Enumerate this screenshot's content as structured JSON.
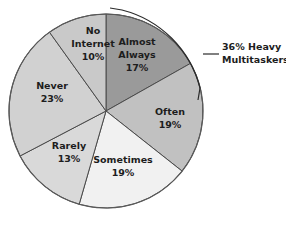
{
  "chart_data": {
    "type": "pie",
    "title": "",
    "subtitle": "",
    "xlabel": "",
    "ylabel": "",
    "grid": false,
    "legend_position": "inside-slices",
    "start_angle_deg": 0,
    "direction": "clockwise",
    "geometry": {
      "cx": 106,
      "cy": 111,
      "r": 97
    },
    "categories": [
      "Almost Always",
      "Often",
      "Sometimes",
      "Rarely",
      "Never",
      "No Internet"
    ],
    "values": [
      17,
      19,
      19,
      13,
      23,
      10
    ],
    "value_suffix": "%",
    "slices": [
      {
        "label": "Almost Always",
        "label_line1": "Almost",
        "label_line2": "Always",
        "value": 17,
        "value_text": "17%",
        "color": "#9a9a9a",
        "label_x": 137,
        "label_y": 50
      },
      {
        "label": "Often",
        "label_line1": "Often",
        "label_line2": "",
        "value": 19,
        "value_text": "19%",
        "color": "#c1c1c1",
        "label_x": 170,
        "label_y": 118
      },
      {
        "label": "Sometimes",
        "label_line1": "Sometimes",
        "label_line2": "",
        "value": 19,
        "value_text": "19%",
        "color": "#f1f1f1",
        "label_x": 123,
        "label_y": 166
      },
      {
        "label": "Rarely",
        "label_line1": "Rarely",
        "label_line2": "",
        "value": 13,
        "value_text": "13%",
        "color": "#d9d9d9",
        "label_x": 69,
        "label_y": 152
      },
      {
        "label": "Never",
        "label_line1": "Never",
        "label_line2": "",
        "value": 23,
        "value_text": "23%",
        "color": "#d1d1d1",
        "label_x": 52,
        "label_y": 92
      },
      {
        "label": "No Internet",
        "label_line1": "No",
        "label_line2": "Internet",
        "value": 10,
        "value_text": "10%",
        "color": "#c9c9c9",
        "label_x": 93,
        "label_y": 44
      }
    ],
    "annotations": [
      {
        "name": "heavy-multitaskers-callout",
        "line1": "36% Heavy",
        "line2": "Multitaskers",
        "covers": [
          "Almost Always",
          "Often"
        ],
        "total": 36,
        "text_x": 226,
        "text_y1": 44,
        "text_y2": 57
      }
    ]
  }
}
